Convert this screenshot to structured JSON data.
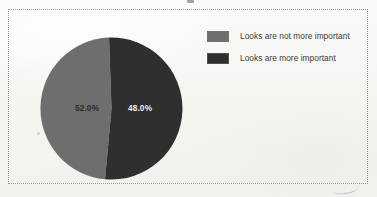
{
  "figure": {
    "background_color": "#f7f7f5",
    "border_color": "#9a9a9a",
    "border_style": "dotted"
  },
  "chart_data": {
    "type": "pie",
    "title": "",
    "xlabel": "",
    "ylabel": "",
    "grid": false,
    "legend_position": "right",
    "start_angle_deg": 90,
    "direction": "clockwise",
    "categories": [
      "Looks are not more important",
      "Looks are more important"
    ],
    "values": [
      52.0,
      48.0
    ],
    "data_labels": [
      "52.0%",
      "48.0%"
    ],
    "colors": [
      "#6e6e6e",
      "#2f2f2f"
    ],
    "label_colors": [
      "#2b2b2b",
      "#ededed"
    ]
  },
  "pie": {
    "slices": [
      {
        "name": "Looks are not more important",
        "percent_label": "52.0%",
        "value": 52.0,
        "color": "#6e6e6e",
        "label_color": "#2b2b2b",
        "label_x": 48,
        "label_y": 75
      },
      {
        "name": "Looks are more important",
        "percent_label": "48.0%",
        "value": 48.0,
        "color": "#2f2f2f",
        "label_color": "#ededed",
        "label_x": 101,
        "label_y": 75
      }
    ],
    "center_x": 72.5,
    "center_y": 72.5,
    "radius": 71
  },
  "legend": {
    "items": [
      {
        "label": "Looks are not more important",
        "color": "#6e6e6e"
      },
      {
        "label": "Looks are more important",
        "color": "#2f2f2f"
      }
    ]
  }
}
